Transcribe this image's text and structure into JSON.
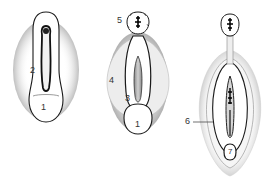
{
  "diagram": {
    "figures": [
      {
        "id": "figure-1",
        "labels": [
          {
            "text": "2",
            "x": 30,
            "y": 66
          },
          {
            "text": "1",
            "x": 40,
            "y": 103
          }
        ]
      },
      {
        "id": "figure-2",
        "labels": [
          {
            "text": "5",
            "x": 117,
            "y": 17
          },
          {
            "text": "4",
            "x": 109,
            "y": 76
          },
          {
            "text": "3",
            "x": 125,
            "y": 94
          },
          {
            "text": "1",
            "x": 134,
            "y": 120
          }
        ]
      },
      {
        "id": "figure-3",
        "labels": [
          {
            "text": "6",
            "x": 186,
            "y": 118
          },
          {
            "text": "7",
            "x": 230,
            "y": 153
          }
        ]
      }
    ],
    "colors": {
      "line": "#1a1a1a",
      "shade": "#bdbdbd",
      "background": "#ffffff"
    }
  }
}
